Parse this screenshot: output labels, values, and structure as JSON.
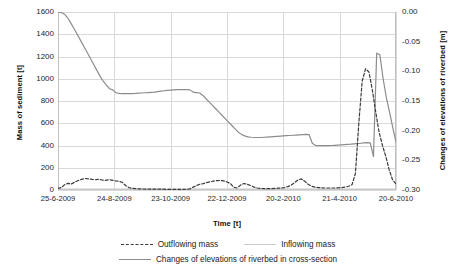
{
  "chart_data": {
    "type": "line",
    "title": "",
    "xlabel": "Time [t]",
    "ylabel": "Mass of sediment [t]",
    "y2label": "Changes of elevations of riverbed [m]",
    "grid": true,
    "legend_position": "bottom",
    "x_tick_labels": [
      "25-6-2009",
      "24-8-2009",
      "23-10-2009",
      "22-12-2009",
      "20-2-2010",
      "21-4-2010",
      "20-6-2010"
    ],
    "y_left_ticks": [
      0,
      200,
      400,
      600,
      800,
      1000,
      1200,
      1400,
      1600
    ],
    "y_left_lim": [
      0,
      1600
    ],
    "y_right_ticks": [
      "0.00",
      "-0.05",
      "-0.10",
      "-0.15",
      "-0.20",
      "-0.25",
      "-0.30"
    ],
    "y_right_lim": [
      -0.3,
      0.0
    ],
    "series": [
      {
        "name": "Outflowing mass",
        "axis": "left",
        "style": "dashed",
        "color": "#3a3a3a",
        "x": [
          0,
          1,
          2,
          3,
          4,
          5,
          6,
          7,
          8,
          9,
          10,
          11,
          12,
          13,
          14,
          15,
          16,
          17,
          18,
          19,
          20,
          21,
          22,
          23,
          24,
          25,
          26,
          27,
          28,
          29,
          30,
          31,
          32,
          33,
          34,
          35,
          36,
          37,
          38,
          39,
          40,
          41,
          42,
          43,
          44,
          45,
          46,
          47,
          48,
          49,
          50,
          51,
          52,
          53,
          54,
          55,
          56,
          57,
          58,
          59,
          60,
          61,
          62,
          63,
          64,
          65,
          66,
          67,
          68,
          69,
          70,
          71,
          72,
          73,
          74,
          75,
          76,
          77,
          78,
          79,
          80,
          81,
          82,
          83,
          84,
          85,
          86,
          87,
          88,
          89,
          90,
          91,
          92,
          93,
          94,
          95,
          96,
          97,
          98,
          99,
          100
        ],
        "values": [
          15,
          22,
          48,
          60,
          55,
          72,
          85,
          96,
          104,
          100,
          96,
          92,
          96,
          90,
          86,
          92,
          88,
          82,
          78,
          70,
          40,
          22,
          14,
          12,
          10,
          9,
          8,
          8,
          7,
          7,
          7,
          7,
          6,
          6,
          6,
          6,
          6,
          6,
          7,
          10,
          26,
          40,
          52,
          58,
          66,
          74,
          80,
          84,
          86,
          82,
          72,
          58,
          24,
          18,
          44,
          58,
          52,
          40,
          26,
          18,
          14,
          12,
          12,
          12,
          14,
          16,
          18,
          22,
          30,
          44,
          66,
          90,
          100,
          78,
          52,
          34,
          26,
          22,
          20,
          18,
          18,
          18,
          18,
          20,
          22,
          26,
          34,
          48,
          150,
          600,
          980,
          1090,
          1060,
          900,
          700,
          520,
          400,
          300,
          180,
          90,
          55
        ]
      },
      {
        "name": "Inflowing mass",
        "axis": "left",
        "style": "solid-light",
        "color": "#c9c9c9",
        "x": [
          0,
          20,
          40,
          60,
          80,
          100
        ],
        "values": [
          8,
          8,
          8,
          8,
          8,
          8
        ]
      },
      {
        "name": "Changes of elevations of riverbed in cross-section",
        "axis": "right",
        "style": "solid",
        "color": "#8c8c8c",
        "x": [
          0,
          1,
          2,
          3,
          4,
          5,
          6,
          7,
          8,
          9,
          10,
          11,
          12,
          13,
          14,
          15,
          16,
          17,
          18,
          19,
          20,
          21,
          22,
          23,
          24,
          25,
          26,
          27,
          28,
          29,
          30,
          31,
          32,
          33,
          34,
          35,
          36,
          37,
          38,
          39,
          40,
          41,
          42,
          43,
          44,
          45,
          46,
          47,
          48,
          49,
          50,
          51,
          52,
          53,
          54,
          55,
          56,
          57,
          58,
          59,
          60,
          61,
          62,
          63,
          64,
          65,
          66,
          67,
          68,
          69,
          70,
          71,
          72,
          73,
          74,
          75,
          76,
          77,
          78,
          79,
          80,
          81,
          82,
          83,
          84,
          85,
          86,
          87,
          88,
          89,
          90,
          91,
          92,
          93,
          94,
          95,
          96,
          97,
          98
        ],
        "values_left_equiv": [
          1598,
          1596,
          1580,
          1548,
          1500,
          1450,
          1398,
          1345,
          1292,
          1240,
          1186,
          1132,
          1080,
          1026,
          980,
          944,
          910,
          900,
          874,
          868,
          866,
          866,
          866,
          867,
          868,
          870,
          872,
          874,
          876,
          878,
          880,
          884,
          888,
          892,
          896,
          898,
          900,
          902,
          902,
          902,
          902,
          900,
          880,
          876,
          872,
          850,
          820,
          790,
          760,
          730,
          700,
          670,
          640,
          610,
          580,
          550,
          520,
          500,
          486,
          478,
          474,
          472,
          472,
          472,
          474,
          476,
          478,
          480,
          482,
          484,
          486,
          488,
          490,
          492,
          494,
          496,
          498,
          500,
          498,
          420,
          400,
          398,
          398,
          398,
          398,
          400,
          402,
          404,
          406,
          408,
          410,
          412,
          415,
          418,
          420,
          424,
          426,
          424,
          300,
          1230,
          1215,
          1000,
          830,
          700,
          560,
          430
        ]
      }
    ]
  },
  "legend": {
    "rows": [
      [
        {
          "label": "Outflowing mass",
          "swatch": "dashed-line-swatch"
        },
        {
          "label": "Inflowing mass",
          "swatch": "light-line-swatch"
        }
      ],
      [
        {
          "label": "Changes of elevations of riverbed in cross-section",
          "swatch": "solid-line-swatch"
        }
      ]
    ]
  }
}
